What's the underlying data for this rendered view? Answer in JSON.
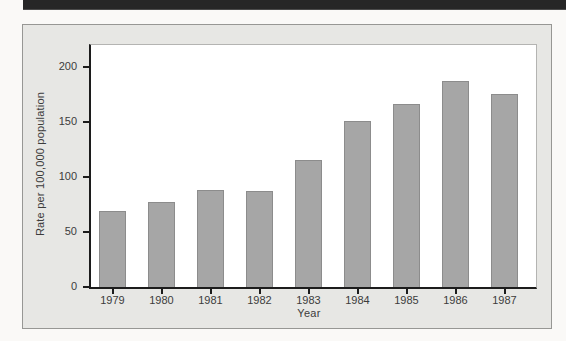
{
  "figure": {
    "kind": "scanned textbook bar chart figure",
    "top_rule_color": "#262626",
    "page_background": "#faf9f7"
  },
  "chart_data": {
    "type": "bar",
    "xlabel": "Year",
    "ylabel": "Rate per 100,000 population",
    "categories": [
      "1979",
      "1980",
      "1981",
      "1982",
      "1983",
      "1984",
      "1985",
      "1986",
      "1987"
    ],
    "values": [
      69,
      77,
      88,
      87,
      115,
      151,
      166,
      187,
      175
    ],
    "ylim": [
      0,
      220
    ],
    "yticks": [
      0,
      50,
      100,
      150,
      200
    ],
    "grid": false,
    "legend": "none",
    "bar_color": "#a6a6a6",
    "bar_border_color": "#8c8c8c",
    "panel_background": "#e7e7e4",
    "plot_background": "#ffffff",
    "axis_color": "#1c1c1c",
    "text_color": "#3c3c3c"
  }
}
